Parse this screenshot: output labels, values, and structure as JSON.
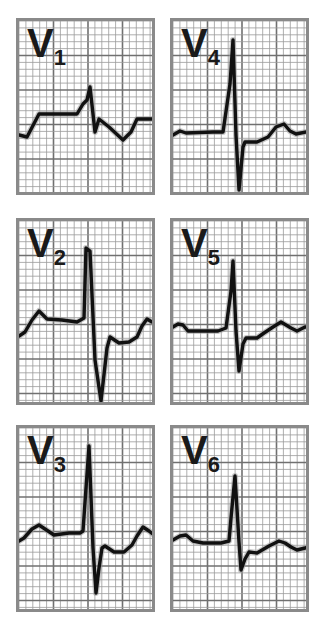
{
  "figure": {
    "background": "#ffffff",
    "grid_minor_color": "#9a9a9a",
    "grid_major_color": "#707070",
    "border_color": "#8a8a8a",
    "trace_color": "#111111",
    "trace_glow_color": "#9a9a9a"
  },
  "panels": [
    {
      "id": "V1",
      "letter": "V",
      "sub": "1",
      "x": 16,
      "y": 18,
      "w": 139,
      "h": 177,
      "trace": "M0,114 L8,116 L20,93 L58,93 L64,83 L68,79 L71,66 L76,111 L80,98 L90,106 L104,119 L112,111 L118,98 L134,98"
    },
    {
      "id": "V4",
      "letter": "V",
      "sub": "4",
      "x": 170,
      "y": 18,
      "w": 139,
      "h": 177,
      "trace": "M0,114 L7,110 L13,112 L40,111 L50,111 L57,63 L60,19 L63,114 L66,169 L70,126 L72,121 L84,121 L95,116 L103,106 L111,103 L117,110 L123,113 L138,110"
    },
    {
      "id": "V2",
      "letter": "V",
      "sub": "2",
      "x": 16,
      "y": 218,
      "w": 139,
      "h": 187,
      "trace": "M0,115 L6,111 L13,99 L20,90 L28,98 L43,99 L58,101 L65,97 L67,27 L71,30 L76,139 L82,180 L88,127 L91,116 L100,122 L110,121 L118,116 L123,105 L128,98 L133,101 L139,103"
    },
    {
      "id": "V5",
      "letter": "V",
      "sub": "5",
      "x": 170,
      "y": 218,
      "w": 139,
      "h": 187,
      "trace": "M0,106 L5,103 L10,104 L15,110 L23,110 L45,110 L53,107 L58,70 L60,40 L63,110 L66,150 L70,123 L73,117 L84,117 L91,112 L100,106 L108,101 L118,107 L124,110 L132,106 L139,106"
    },
    {
      "id": "V3",
      "letter": "V",
      "sub": "3",
      "x": 16,
      "y": 425,
      "w": 139,
      "h": 187,
      "trace": "M0,113 L5,110 L13,101 L20,97 L26,101 L35,107 L50,105 L61,105 L64,103 L67,60 L70,18 L74,120 L77,165 L80,140 L83,120 L86,118 L95,124 L105,124 L113,117 L118,108 L124,99 L130,103 L135,107 L139,108"
    },
    {
      "id": "V6",
      "letter": "V",
      "sub": "6",
      "x": 170,
      "y": 425,
      "w": 139,
      "h": 187,
      "trace": "M0,112 L7,108 L13,107 L20,113 L30,115 L48,115 L56,113 L58,90 L62,48 L66,114 L68,142 L72,131 L76,124 L84,125 L96,118 L106,113 L112,115 L118,119 L124,122 L132,120 L139,118"
    }
  ]
}
